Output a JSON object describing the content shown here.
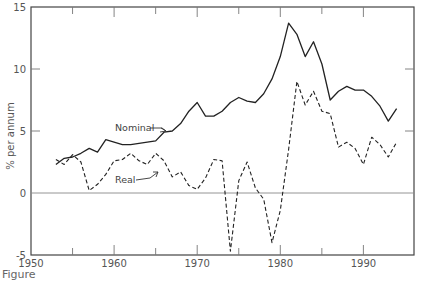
{
  "chart_data": {
    "type": "line",
    "title": "",
    "xlabel": "",
    "ylabel": "% per annum",
    "xlim": [
      1950,
      1996
    ],
    "ylim": [
      -5,
      15
    ],
    "x_ticks": [
      1950,
      1955,
      1960,
      1965,
      1970,
      1975,
      1980,
      1985,
      1990
    ],
    "x_tick_labels": [
      "1950",
      "1960",
      "1970",
      "1980",
      "1990"
    ],
    "y_ticks": [
      -5,
      0,
      5,
      10,
      15
    ],
    "y_tick_labels": [
      "-5",
      "0",
      "5",
      "10",
      "15"
    ],
    "grid": false,
    "zero_line": true,
    "legend": "inline labels with arrows",
    "x": [
      1953,
      1954,
      1955,
      1956,
      1957,
      1958,
      1959,
      1960,
      1961,
      1962,
      1963,
      1964,
      1965,
      1966,
      1967,
      1968,
      1969,
      1970,
      1971,
      1972,
      1973,
      1974,
      1975,
      1976,
      1977,
      1978,
      1979,
      1980,
      1981,
      1982,
      1983,
      1984,
      1985,
      1986,
      1987,
      1988,
      1989,
      1990,
      1991,
      1992,
      1993,
      1994
    ],
    "series": [
      {
        "name": "Nominal",
        "style": "solid",
        "values": [
          2.3,
          2.8,
          2.9,
          3.2,
          3.6,
          3.3,
          4.3,
          4.1,
          3.9,
          3.9,
          4.0,
          4.1,
          4.2,
          4.9,
          5.0,
          5.6,
          6.6,
          7.3,
          6.2,
          6.2,
          6.6,
          7.3,
          7.7,
          7.4,
          7.3,
          8.0,
          9.2,
          11.0,
          13.7,
          12.8,
          11.0,
          12.2,
          10.4,
          7.5,
          8.2,
          8.6,
          8.3,
          8.3,
          7.8,
          7.0,
          5.8,
          6.8
        ]
      },
      {
        "name": "Real",
        "style": "dashed",
        "values": [
          2.7,
          2.3,
          3.1,
          2.5,
          0.2,
          0.7,
          1.5,
          2.6,
          2.7,
          3.2,
          2.6,
          2.3,
          3.2,
          2.6,
          1.3,
          1.7,
          0.6,
          0.3,
          1.2,
          2.7,
          2.6,
          -4.7,
          1.0,
          2.5,
          0.4,
          -0.5,
          -4.0,
          -1.4,
          3.5,
          9.0,
          7.1,
          8.2,
          6.6,
          6.4,
          3.7,
          4.1,
          3.6,
          2.3,
          4.5,
          3.9,
          2.9,
          4.1
        ]
      }
    ],
    "annotations": [
      {
        "text": "Nominal",
        "points_to_year": 1966
      },
      {
        "text": "Real",
        "points_to_year": 1965
      }
    ]
  },
  "caption": "Figure"
}
